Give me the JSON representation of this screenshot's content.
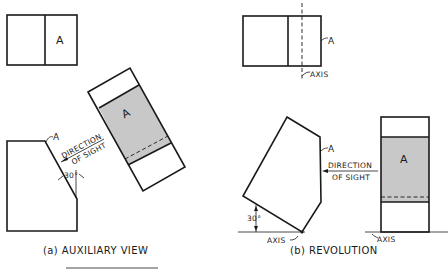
{
  "figure_a": {
    "caption": "(a) AUXILIARY VIEW",
    "top_view_label": "A",
    "front_view_label": "A",
    "auxiliary_view_label": "A",
    "direction_line1": "DIRECTION",
    "direction_line2": "OF SIGHT",
    "angle": "30°"
  },
  "figure_b": {
    "caption": "(b) REVOLUTION",
    "top_view_label": "A",
    "top_axis_label": "AXIS",
    "revolved_label": "A",
    "revolved_axis_label": "AXIS",
    "angle": "30°",
    "direction_line1": "DIRECTION",
    "direction_line2": "OF SIGHT",
    "side_view_label": "A",
    "side_axis_label": "AXIS"
  },
  "colors": {
    "line": "#1a1a1a",
    "shade": "#c8c8c8",
    "background": "#ffffff"
  }
}
